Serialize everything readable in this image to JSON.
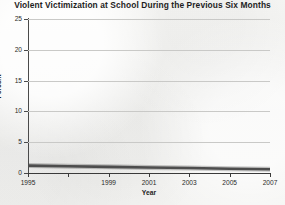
{
  "chart_data": {
    "type": "line",
    "title": "Violent Victimization at School During the Previous Six Months",
    "xlabel": "Year",
    "ylabel": "Percent",
    "xlim": [
      1995,
      2007
    ],
    "ylim": [
      0,
      25
    ],
    "grid": true,
    "legend": "none",
    "y_ticks": [
      0,
      5,
      10,
      15,
      20,
      25
    ],
    "y_tick_labels": [
      "0",
      "5",
      "10",
      "15",
      "20",
      "25"
    ],
    "x_ticks": [
      1995,
      1997,
      1999,
      2001,
      2003,
      2005,
      2007
    ],
    "x_tick_labels": [
      "1995",
      "",
      "1999",
      "2001",
      "2003",
      "2005",
      "2007"
    ],
    "series": [
      {
        "name": "Violent victimization rate",
        "color": "#4d4d4d",
        "x": [
          1995,
          1997,
          1999,
          2001,
          2003,
          2005,
          2007
        ],
        "values": [
          1.2,
          1.1,
          1.0,
          0.9,
          0.8,
          0.7,
          0.6
        ]
      }
    ]
  },
  "axis": {
    "y_title": "Percent",
    "x_title": "Year"
  }
}
